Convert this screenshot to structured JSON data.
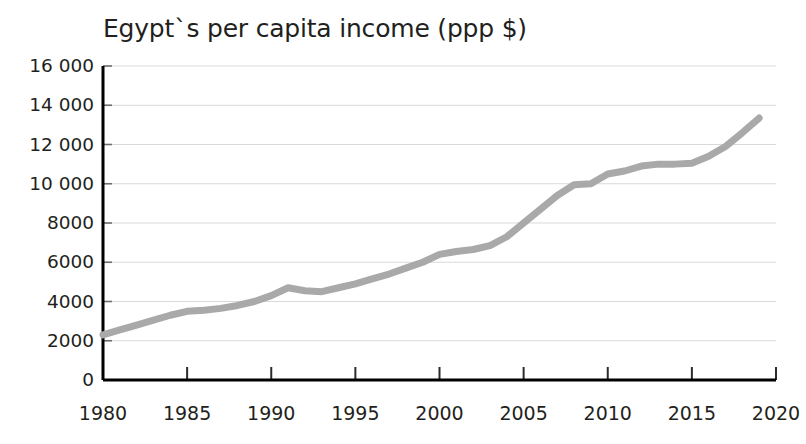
{
  "chart_data": {
    "type": "line",
    "title": "Egypt`s per capita income (ppp $)",
    "xlabel": "",
    "ylabel": "",
    "xlim": [
      1980,
      2020
    ],
    "ylim": [
      0,
      16000
    ],
    "grid": true,
    "legend": "none",
    "line_color": "#a9a9a9",
    "axis_color": "#000000",
    "grid_color": "#d9d9d9",
    "background_color": "#ffffff",
    "x_ticks": [
      1980,
      1985,
      1990,
      1995,
      2000,
      2005,
      2010,
      2015,
      2020
    ],
    "x_tick_labels": [
      "1980",
      "1985",
      "1990",
      "1995",
      "2000",
      "2005",
      "2010",
      "2015",
      "2020"
    ],
    "y_ticks": [
      0,
      2000,
      4000,
      6000,
      8000,
      10000,
      12000,
      14000,
      16000
    ],
    "y_tick_labels": [
      "0",
      "2000",
      "4000",
      "6000",
      "8000",
      "10 000",
      "12 000",
      "14 000",
      "16 000"
    ],
    "series": [
      {
        "name": "Egypt per capita income (ppp $)",
        "x": [
          1980,
          1981,
          1982,
          1983,
          1984,
          1985,
          1986,
          1987,
          1988,
          1989,
          1990,
          1991,
          1992,
          1993,
          1994,
          1995,
          1996,
          1997,
          1998,
          1999,
          2000,
          2001,
          2002,
          2003,
          2004,
          2005,
          2006,
          2007,
          2008,
          2009,
          2010,
          2011,
          2012,
          2013,
          2014,
          2015,
          2016,
          2017,
          2018,
          2019
        ],
        "values": [
          2300,
          2550,
          2800,
          3050,
          3300,
          3500,
          3550,
          3650,
          3800,
          4000,
          4300,
          4700,
          4550,
          4500,
          4700,
          4900,
          5150,
          5400,
          5700,
          6000,
          6400,
          6550,
          6650,
          6850,
          7300,
          8000,
          8700,
          9400,
          9950,
          10000,
          10500,
          10650,
          10900,
          11000,
          11000,
          11050,
          11400,
          11900,
          12600,
          13350
        ]
      }
    ]
  },
  "chart": {
    "title": "Egypt`s per capita income (ppp $)"
  }
}
